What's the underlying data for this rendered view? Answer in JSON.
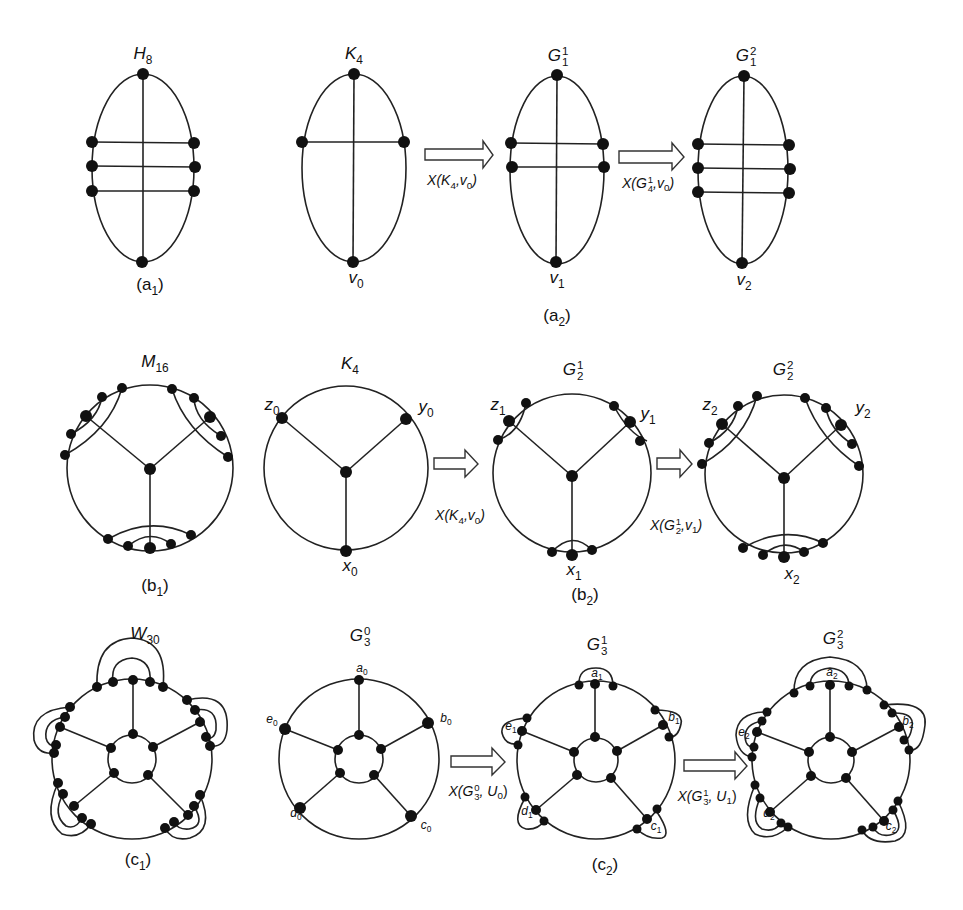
{
  "figure": {
    "rows": [
      {
        "id": "a",
        "panels": [
          {
            "id": "a1",
            "caption": "(a",
            "caption_sub": "1",
            "caption_end": ")"
          },
          {
            "id": "a2",
            "caption": "(a",
            "caption_sub": "2",
            "caption_end": ")"
          }
        ],
        "graphs": [
          {
            "name": "H",
            "sub": "8"
          },
          {
            "name": "K",
            "sub": "4",
            "bottom_vertex": "v",
            "bottom_vertex_sub": "0"
          },
          {
            "name": "G",
            "sub": "1",
            "sup": "1",
            "bottom_vertex": "v",
            "bottom_vertex_sub": "1"
          },
          {
            "name": "G",
            "sub": "1",
            "sup": "2",
            "bottom_vertex": "v",
            "bottom_vertex_sub": "2"
          }
        ],
        "operations": [
          {
            "text": "X(K",
            "sub": "4",
            "rest": ",v",
            "rest_sub": "0",
            "end": ")"
          },
          {
            "text": "X(G",
            "sup": "1",
            "sub": "4",
            "rest": ",v",
            "rest_sub": "0",
            "end": ")"
          }
        ]
      },
      {
        "id": "b",
        "panels": [
          {
            "id": "b1",
            "caption": "(b",
            "caption_sub": "1",
            "caption_end": ")"
          },
          {
            "id": "b2",
            "caption": "(b",
            "caption_sub": "2",
            "caption_end": ")"
          }
        ],
        "graphs": [
          {
            "name": "M",
            "sub": "16"
          },
          {
            "name": "K",
            "sub": "4",
            "vertices": {
              "z": "z0",
              "y": "y0",
              "x": "x0"
            }
          },
          {
            "name": "G",
            "sub": "2",
            "sup": "1",
            "vertices": {
              "z": "z1",
              "y": "y1",
              "x": "x1"
            }
          },
          {
            "name": "G",
            "sub": "2",
            "sup": "2",
            "vertices": {
              "z": "z2",
              "y": "y2",
              "x": "x2"
            }
          }
        ],
        "operations": [
          {
            "text": "X(K",
            "sub": "4",
            "rest": ",v",
            "rest_sub": "0",
            "end": ")"
          },
          {
            "text": "X(G",
            "sup": "1",
            "sub": "2",
            "rest": ",v",
            "rest_sub": "1",
            "end": ")"
          }
        ]
      },
      {
        "id": "c",
        "panels": [
          {
            "id": "c1",
            "caption": "(c",
            "caption_sub": "1",
            "caption_end": ")"
          },
          {
            "id": "c2",
            "caption": "(c",
            "caption_sub": "2",
            "caption_end": ")"
          }
        ],
        "graphs": [
          {
            "name": "W",
            "sub": "30"
          },
          {
            "name": "G",
            "sub": "3",
            "sup": "0",
            "vertices": [
              "a0",
              "b0",
              "c0",
              "d0",
              "e0"
            ]
          },
          {
            "name": "G",
            "sub": "3",
            "sup": "1",
            "vertices": [
              "a1",
              "b1",
              "c1",
              "d1",
              "e1"
            ]
          },
          {
            "name": "G",
            "sub": "3",
            "sup": "2",
            "vertices": [
              "a2",
              "b2",
              "c2",
              "d2",
              "e2"
            ]
          }
        ],
        "operations": [
          {
            "text": "X(G",
            "sup": "0",
            "sub": "3",
            "rest": ", U",
            "rest_sub": "0",
            "end": ")"
          },
          {
            "text": "X(G",
            "sup": "1",
            "sub": "3",
            "rest": ", U",
            "rest_sub": "1",
            "end": ")"
          }
        ]
      }
    ]
  },
  "vertex_labels": {
    "a": {
      "v0": [
        "v",
        "0"
      ],
      "v1": [
        "v",
        "1"
      ],
      "v2": [
        "v",
        "2"
      ]
    },
    "b": {
      "z0": [
        "z",
        "0"
      ],
      "y0": [
        "y",
        "0"
      ],
      "x0": [
        "x",
        "0"
      ],
      "z1": [
        "z",
        "1"
      ],
      "y1": [
        "y",
        "1"
      ],
      "x1": [
        "x",
        "1"
      ],
      "z2": [
        "z",
        "2"
      ],
      "y2": [
        "y",
        "2"
      ],
      "x2": [
        "x",
        "2"
      ]
    },
    "c": {
      "a0": [
        "a",
        "0"
      ],
      "b0": [
        "b",
        "0"
      ],
      "c0": [
        "c",
        "0"
      ],
      "d0": [
        "d",
        "0"
      ],
      "e0": [
        "e",
        "0"
      ],
      "a1": [
        "a",
        "1"
      ],
      "b1": [
        "b",
        "1"
      ],
      "c1": [
        "c",
        "1"
      ],
      "d1": [
        "d",
        "1"
      ],
      "e1": [
        "e",
        "1"
      ],
      "a2": [
        "a",
        "2"
      ],
      "b2": [
        "b",
        "2"
      ],
      "c2": [
        "c",
        "2"
      ],
      "d2": [
        "d",
        "2"
      ],
      "e2": [
        "e",
        "2"
      ]
    }
  }
}
